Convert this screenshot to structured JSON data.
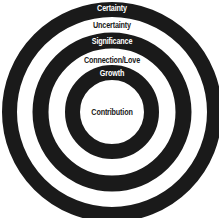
{
  "diagram": {
    "colors": {
      "ring": "#1a1a1a",
      "background": "#ffffff",
      "text_on_ring": "#ffffff",
      "text_on_white": "#1a1a1a"
    },
    "layers": [
      {
        "label": "Certainty",
        "type": "ring"
      },
      {
        "label": "Uncertainty",
        "type": "gap"
      },
      {
        "label": "Significance",
        "type": "ring"
      },
      {
        "label": "Connection/Love",
        "type": "gap"
      },
      {
        "label": "Growth",
        "type": "ring"
      },
      {
        "label": "Contribution",
        "type": "center"
      }
    ]
  }
}
